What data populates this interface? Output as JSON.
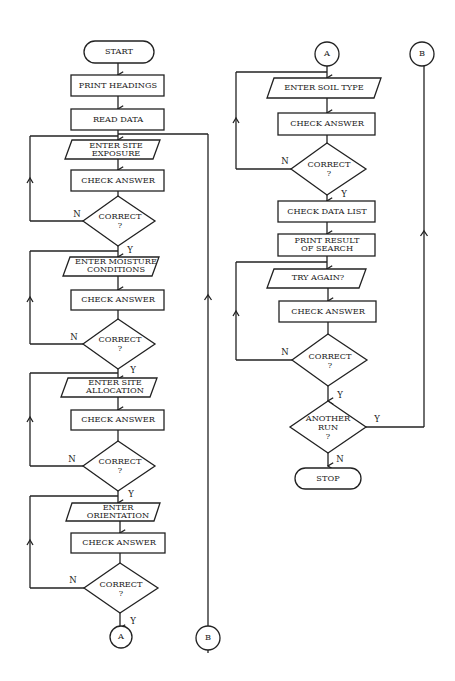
{
  "diagram": {
    "type": "flowchart",
    "left_column": {
      "start": "START",
      "print_headings": "PRINT HEADINGS",
      "read_data": "READ DATA",
      "steps": [
        {
          "input_l1": "ENTER SITE",
          "input_l2": "EXPOSURE",
          "check": "CHECK ANSWER",
          "decision": "CORRECT",
          "q": "?",
          "no": "N",
          "yes": "Y"
        },
        {
          "input_l1": "ENTER MOISTURE",
          "input_l2": "CONDITIONS",
          "check": "CHECK ANSWER",
          "decision": "CORRECT",
          "q": "?",
          "no": "N",
          "yes": "Y"
        },
        {
          "input_l1": "ENTER SITE",
          "input_l2": "ALLOCATION",
          "check": "CHECK ANSWER",
          "decision": "CORRECT",
          "q": "?",
          "no": "N",
          "yes": "Y"
        },
        {
          "input_l1": "ENTER",
          "input_l2": "ORIENTATION",
          "check": "CHECK ANSWER",
          "decision": "CORRECT",
          "q": "?",
          "no": "N",
          "yes": "Y"
        }
      ],
      "connector_a": "A",
      "connector_b": "B"
    },
    "right_column": {
      "connector_a": "A",
      "connector_b": "B",
      "soil": {
        "input": "ENTER SOIL TYPE",
        "check": "CHECK ANSWER",
        "decision": "CORRECT",
        "q": "?",
        "no": "N",
        "yes": "Y"
      },
      "check_data_list": "CHECK DATA LIST",
      "print_result_l1": "PRINT RESULT",
      "print_result_l2": "OF SEARCH",
      "try": {
        "input": "TRY AGAIN?",
        "check": "CHECK ANSWER",
        "decision": "CORRECT",
        "q": "?",
        "no": "N",
        "yes": "Y"
      },
      "another_l1": "ANOTHER",
      "another_l2": "RUN",
      "another_q": "?",
      "another_yes": "Y",
      "another_no": "N",
      "stop": "STOP"
    }
  }
}
